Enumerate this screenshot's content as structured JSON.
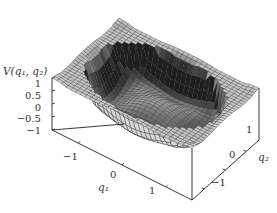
{
  "chart_data": {
    "type": "surface3d",
    "title": "",
    "zlabel": "V(q₁, q₂)",
    "xlabel": "q₁",
    "ylabel": "q₂",
    "zlim": [
      -1,
      1
    ],
    "xlim": [
      -1.6,
      1.6
    ],
    "ylim": [
      -1.6,
      1.6
    ],
    "z_ticks": [
      "1",
      "0.5",
      "0",
      "−0.5",
      "−1"
    ],
    "x_ticks": [
      "−1",
      "0",
      "1"
    ],
    "y_ticks": [
      "1",
      "0",
      "−1"
    ],
    "grid_resolution": 30,
    "colors": {
      "surface_light": "#c8c8c8",
      "surface_dark": "#2a2a2a",
      "mesh_line": "#1a1a1a",
      "box": "#222222"
    }
  },
  "labels": {
    "z_axis_title": "V(q₁, q₂)",
    "x_axis_title": "q₁",
    "y_axis_title": "q₂",
    "z_ticks": [
      "1",
      "0.5",
      "0",
      "−0.5",
      "−1"
    ],
    "x_ticks": [
      "−1",
      "0",
      "1"
    ],
    "y_ticks": [
      "1",
      "0",
      "−1"
    ]
  }
}
